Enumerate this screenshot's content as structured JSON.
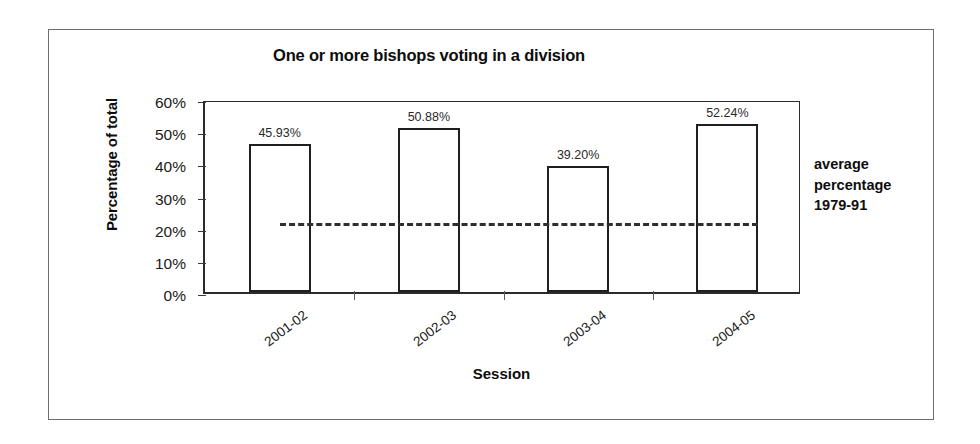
{
  "chart_data": {
    "type": "bar",
    "title": "One or more bishops voting in a division",
    "xlabel": "Session",
    "ylabel": "Percentage of total",
    "categories": [
      "2001-02",
      "2002-03",
      "2003-04",
      "2004-05"
    ],
    "values": [
      45.93,
      50.88,
      39.2,
      52.24
    ],
    "value_labels": [
      "45.93%",
      "50.88%",
      "39.20%",
      "52.24%"
    ],
    "ylim": [
      0,
      60
    ],
    "ytick_values": [
      60,
      50,
      40,
      30,
      20,
      10,
      0
    ],
    "ytick_labels": [
      "60%",
      "50%",
      "40%",
      "30%",
      "20%",
      "10%",
      "0%"
    ],
    "grid": false,
    "legend_position": "none",
    "bar_style": {
      "fill": "#ffffff",
      "edge": "#1f1f1f"
    },
    "reference_line": {
      "label": "average percentage 1979-91",
      "label_lines": [
        "average",
        "percentage",
        "1979-91"
      ],
      "value": 22.3,
      "style": "dashed",
      "color": "#2e2e2e"
    },
    "colors": {
      "axis": "#2b2b2b",
      "text": "#0d0d0d",
      "frame": "#6c6c6c"
    }
  }
}
